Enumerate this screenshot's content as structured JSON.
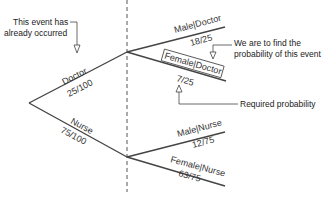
{
  "diagram": {
    "type": "probability-tree",
    "annotations": {
      "occurred_line1": "This event has",
      "occurred_line2": "already occurred",
      "find_line1": "We are to find the",
      "find_line2": "probability of this event",
      "required": "Required probability"
    },
    "level1": [
      {
        "label": "Doctor",
        "prob": "25/100"
      },
      {
        "label": "Nurse",
        "prob": "75/100"
      }
    ],
    "level2": [
      {
        "label": "Male|Doctor",
        "prob": "18/25"
      },
      {
        "label": "Female|Doctor",
        "prob": "7/25",
        "highlighted": true
      },
      {
        "label": "Male|Nurse",
        "prob": "12/75"
      },
      {
        "label": "Female|Nurse",
        "prob": "63/75"
      }
    ],
    "colors": {
      "line": "#444444",
      "text": "#333333"
    }
  }
}
